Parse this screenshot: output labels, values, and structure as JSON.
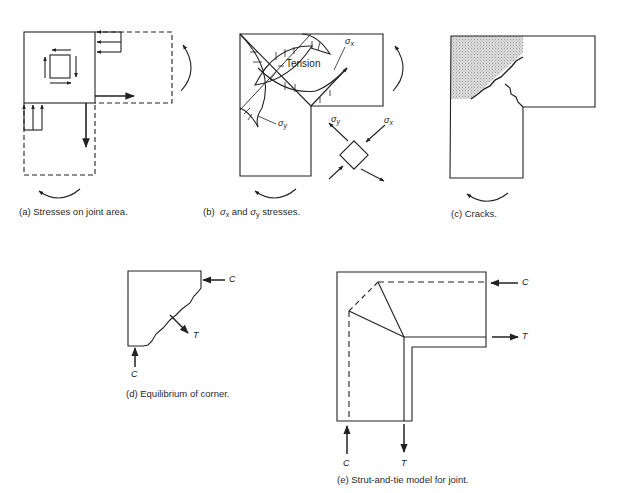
{
  "figures": {
    "a": {
      "caption": "(a)  Stresses on joint area."
    },
    "b": {
      "caption_prefix": "(b)",
      "caption_sigma_x": "σ",
      "caption_sub_x": "x",
      "caption_and": " and ",
      "caption_sigma_y": "σ",
      "caption_sub_y": "y",
      "caption_suffix": " stresses.",
      "label_tension": "Tension",
      "label_sigma": "σ",
      "label_sub_x": "x",
      "label_sub_y": "y"
    },
    "c": {
      "caption": "(c)  Cracks."
    },
    "d": {
      "caption": "(d)  Equilibrium of corner.",
      "label_c_right": "C",
      "label_t": "T",
      "label_c_bottom": "C"
    },
    "e": {
      "caption": "(e)  Strut-and-tie model for joint.",
      "label_c_right": "C",
      "label_t_right": "T",
      "label_c_bottom": "C",
      "label_t_bottom": "T"
    }
  },
  "colors": {
    "stroke": "#222222",
    "shade": "#cfcfcf",
    "background": "#ffffff"
  }
}
